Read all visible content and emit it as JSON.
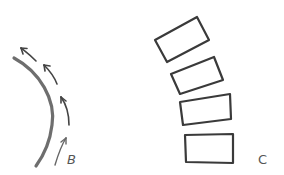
{
  "figure": {
    "panels": [
      {
        "id": "B",
        "label": "B",
        "description": "Curved line with arrows along its outer side pointing upward along the curve",
        "arrow_count": 4
      },
      {
        "id": "C",
        "label": "C",
        "description": "Four stacked rectangles progressively rotated, forming a curve",
        "rectangle_count": 4
      }
    ],
    "colors": {
      "stroke": "#3a3a3a",
      "curve": "#6e6e6e",
      "arrow": "#444444",
      "label": "#555555",
      "background": "#ffffff"
    }
  }
}
